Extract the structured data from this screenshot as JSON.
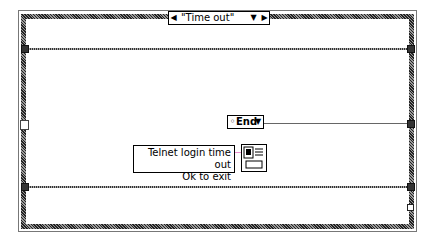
{
  "case_structure": {
    "selector_value": "\"Time out\"",
    "decrement_arrow": "◀",
    "dropdown_arrow": "▼",
    "increment_arrow": "▶"
  },
  "enum_constant": {
    "value": "End",
    "prefix_icon": "◦",
    "dropdown_arrow": "▼"
  },
  "string_constant": {
    "line1": "Telnet login time out",
    "line2": "Ok to exit"
  },
  "dialog_node": {
    "icon": "one-button-dialog-icon"
  },
  "colors": {
    "frame": "#555555",
    "wire": "#666666",
    "background": "#ffffff"
  }
}
